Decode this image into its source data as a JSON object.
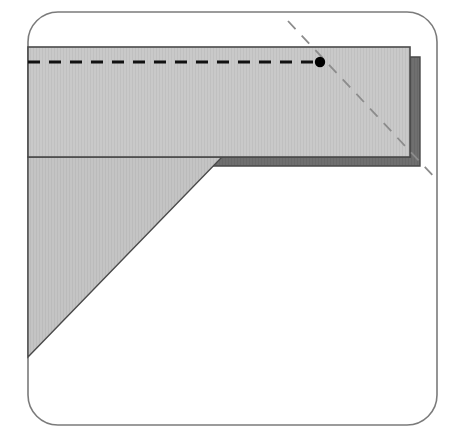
{
  "figure": {
    "canvas": {
      "width": 453,
      "height": 440,
      "background": "#ffffff"
    },
    "colors": {
      "background": "#ffffff",
      "frame_stroke": "#7b7b7b",
      "band_fill": "#c9c9c9",
      "band_stroke": "#4a4a4a",
      "band_shadow_fill": "#6f6f6f",
      "band_shadow_stroke": "#4a4a4a",
      "triangle_fill": "#c4c4c4",
      "triangle_stroke": "#4a4a4a",
      "fold_line": "#111111",
      "diagonal_line": "#8c8c8c",
      "vertex_dot": "#000000",
      "hatch_line": "#bdbdbd"
    },
    "frame": {
      "label": "outer rounded frame",
      "x": 28,
      "y": 12,
      "width": 409,
      "height": 413,
      "radius": 30,
      "stroke_width": 1.6
    },
    "band": {
      "label": "horizontal gray band",
      "x": 28,
      "y": 47,
      "width": 382,
      "height": 110,
      "stroke_width": 1.6
    },
    "band_shadow": {
      "label": "band thickness shadow",
      "points": "410,57 420,57 420,166 38,166 38,157 410,157",
      "right_offset_x": 10,
      "bottom_offset_y": 9,
      "stroke_width": 1.4
    },
    "triangle": {
      "label": "lower left gray triangle",
      "points": "28,157 222,157 28,357",
      "vertices": [
        {
          "name": "top-left",
          "x": 28,
          "y": 157
        },
        {
          "name": "top-right",
          "x": 222,
          "y": 157
        },
        {
          "name": "bottom-left",
          "x": 28,
          "y": 357
        }
      ],
      "stroke_width": 1.4
    },
    "fold_line": {
      "label": "horizontal dashed fold line",
      "x1": 28,
      "y1": 62,
      "x2": 320,
      "y2": 62,
      "stroke_width": 3,
      "dash_pattern": "12,9"
    },
    "diagonal_line": {
      "label": "dashed diagonal crease line",
      "x1": 288,
      "y1": 21,
      "x2": 437,
      "y2": 180,
      "stroke_width": 1.8,
      "dash_pattern": "11,9",
      "angle_degrees": 45
    },
    "vertex_dot": {
      "label": "intersection point marker",
      "cx": 320,
      "cy": 62,
      "r": 5.2
    }
  }
}
